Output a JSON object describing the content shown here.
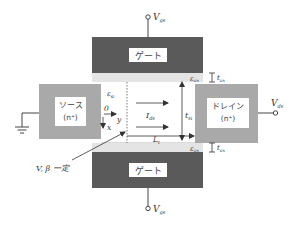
{
  "diagram": {
    "type": "double-gate MOSFET cross-section",
    "colors": {
      "gate": "#5a5a5a",
      "oxide": "#e4e4e4",
      "source_drain": "#a9a9a9",
      "label_box": "#ffffff",
      "line": "#444444"
    },
    "top_gate": {
      "label": "ゲート",
      "terminal": "V",
      "terminal_sub": "gs"
    },
    "bottom_gate": {
      "label": "ゲート",
      "terminal": "V",
      "terminal_sub": "gs"
    },
    "source": {
      "label": "ソース",
      "doping": "(n⁺)"
    },
    "drain": {
      "label": "ドレイン",
      "doping": "(n⁺)",
      "terminal": "V",
      "terminal_sub": "ds"
    },
    "labels": {
      "eps_ox_top": "ε",
      "eps_ox_top_sub": "ox",
      "eps_ox_bottom": "ε",
      "eps_ox_bottom_sub": "ox",
      "t_ox_top": "t",
      "t_ox_top_sub": "ox",
      "t_ox_bottom": "t",
      "t_ox_bottom_sub": "ox",
      "eps_si": "ε",
      "eps_si_sub": "si",
      "origin": "0",
      "axis_x": "x",
      "axis_y": "y",
      "current": "I",
      "current_sub": "ds",
      "t_si": "t",
      "t_si_sub": "si",
      "L_t": "L",
      "L_t_sub": "t",
      "annotation": "V, β 一定"
    }
  }
}
